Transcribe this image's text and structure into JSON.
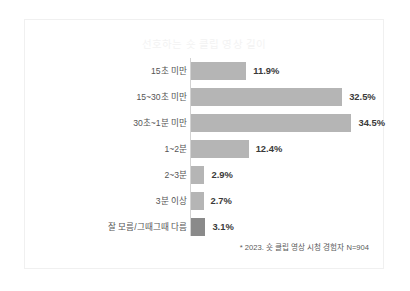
{
  "chart_data": {
    "type": "bar",
    "orientation": "horizontal",
    "title": "선호하는 숏 클립 영상 길이",
    "xlabel": "",
    "ylabel": "",
    "grid": false,
    "legend": "none",
    "xlim": [
      0,
      40
    ],
    "value_suffix": "%",
    "footnote": "* 2023. 숏 클립 영상 시청 경험자 N=904",
    "categories": [
      "15초 미만",
      "15~30초 미만",
      "30초~1분 미만",
      "1~2분",
      "2~3분",
      "3분 이상",
      "잘 모름/그때그때 다름"
    ],
    "values": [
      11.9,
      32.5,
      34.5,
      12.4,
      2.9,
      2.7,
      3.1
    ],
    "value_labels": [
      "11.9%",
      "32.5%",
      "34.5%",
      "12.4%",
      "2.9%",
      "2.7%",
      "3.1%"
    ],
    "bars": [
      {
        "label": "15초 미만",
        "value": 11.9,
        "value_label": "11.9%",
        "accent": false
      },
      {
        "label": "15~30초 미만",
        "value": 32.5,
        "value_label": "32.5%",
        "accent": false
      },
      {
        "label": "30초~1분 미만",
        "value": 34.5,
        "value_label": "34.5%",
        "accent": false
      },
      {
        "label": "1~2분",
        "value": 12.4,
        "value_label": "12.4%",
        "accent": false
      },
      {
        "label": "2~3분",
        "value": 2.9,
        "value_label": "2.9%",
        "accent": false
      },
      {
        "label": "3분 이상",
        "value": 2.7,
        "value_label": "2.7%",
        "accent": false
      },
      {
        "label": "잘 모름/그때그때 다름",
        "value": 3.1,
        "value_label": "3.1%",
        "accent": true
      }
    ],
    "colors": {
      "bar": "#b5b5b5",
      "bar_accent": "#8a8a8a",
      "axis": "#d2d2d2",
      "label_text": "#555555",
      "value_text": "#3a3a3a",
      "title_text": "#f3f3f3",
      "footnote_text": "#5a5a5a",
      "card_border": "#f0f0f0",
      "background": "#ffffff"
    }
  }
}
